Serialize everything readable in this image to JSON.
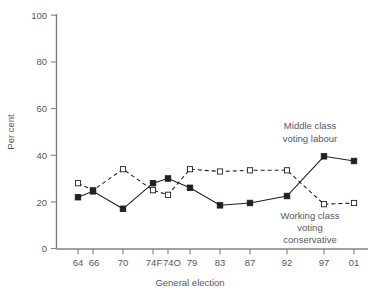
{
  "chart_data": {
    "type": "line",
    "title": "",
    "xlabel": "General election",
    "ylabel": "Per cent",
    "categories": [
      "64",
      "66",
      "70",
      "74F",
      "74O",
      "79",
      "83",
      "87",
      "92",
      "97",
      "01"
    ],
    "ylim": [
      0,
      100
    ],
    "yticks": [
      0,
      20,
      40,
      60,
      80,
      100
    ],
    "grid": false,
    "legend_position": "inline-annotations",
    "series": [
      {
        "name": "Middle class voting labour",
        "marker": "filled-square",
        "line_style": "solid",
        "color": "#231f20",
        "values": [
          22,
          24.5,
          17,
          28,
          30,
          26,
          18.5,
          19.5,
          22.5,
          39.5,
          37.5
        ]
      },
      {
        "name": "Working class voting conservative",
        "marker": "open-square",
        "line_style": "dashed",
        "color": "#231f20",
        "values": [
          28,
          25,
          34,
          25,
          23,
          34,
          33,
          33.5,
          33.5,
          19,
          19.5
        ]
      }
    ],
    "annotations": [
      {
        "id": "middle-class-labour",
        "lines": [
          "Middle class",
          "voting labour"
        ]
      },
      {
        "id": "working-class-conservative",
        "lines": [
          "Working class",
          "voting",
          "conservative"
        ]
      }
    ]
  }
}
